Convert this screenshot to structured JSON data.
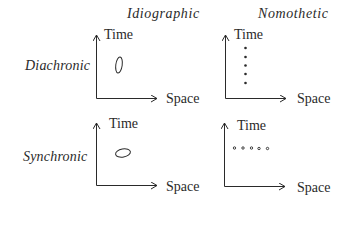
{
  "columns": [
    {
      "label": "Idiographic"
    },
    {
      "label": "Nomothetic"
    }
  ],
  "rows": [
    {
      "label": "Diachronic"
    },
    {
      "label": "Synchronic"
    }
  ],
  "panels": [
    {
      "id": "diachronic-idiographic",
      "y_axis": "Time",
      "x_axis": "Space",
      "mark": "vertical-ellipse"
    },
    {
      "id": "diachronic-nomothetic",
      "y_axis": "Time",
      "x_axis": "Space",
      "mark": "vertical-dot-column",
      "dot_count": 5
    },
    {
      "id": "synchronic-idiographic",
      "y_axis": "Time",
      "x_axis": "Space",
      "mark": "horizontal-ellipse"
    },
    {
      "id": "synchronic-nomothetic",
      "y_axis": "Time",
      "x_axis": "Space",
      "mark": "horizontal-dot-row",
      "dot_count": 5
    }
  ],
  "colors": {
    "ink": "#2a2a2a",
    "background": "#ffffff"
  }
}
